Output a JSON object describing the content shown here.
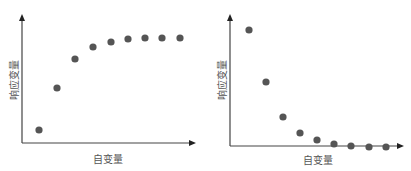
{
  "chart_data": [
    {
      "type": "scatter",
      "title": "",
      "xlabel": "自变量",
      "ylabel": "响应变量",
      "grid": false,
      "legend": null,
      "trend": "increasing, saturating (concave)",
      "x": [
        1,
        2,
        3,
        4,
        5,
        6,
        7,
        8,
        9
      ],
      "y": [
        0.12,
        0.53,
        0.8,
        0.91,
        0.96,
        0.99,
        1.0,
        1.0,
        1.0
      ],
      "point_color": "#555555",
      "axis_color": "#444444",
      "pixel_points": [
        [
          39,
          130
        ],
        [
          57,
          88
        ],
        [
          75,
          59
        ],
        [
          93,
          47
        ],
        [
          111,
          42
        ],
        [
          128,
          39
        ],
        [
          145,
          38
        ],
        [
          162,
          38
        ],
        [
          180,
          38
        ]
      ],
      "axes": {
        "origin": [
          22,
          143
        ],
        "x_end": 196,
        "y_top": 14
      }
    },
    {
      "type": "scatter",
      "title": "",
      "xlabel": "自变量",
      "ylabel": "响应变量",
      "grid": false,
      "legend": null,
      "trend": "decreasing, decaying (convex)",
      "x": [
        1,
        2,
        3,
        4,
        5,
        6,
        7,
        8,
        9
      ],
      "y": [
        1.0,
        0.55,
        0.24,
        0.11,
        0.05,
        0.02,
        0.01,
        0.0,
        0.0
      ],
      "point_color": "#555555",
      "axis_color": "#444444",
      "pixel_points": [
        [
          249,
          30
        ],
        [
          266,
          82
        ],
        [
          283,
          117
        ],
        [
          300,
          133
        ],
        [
          317,
          140
        ],
        [
          334,
          144
        ],
        [
          351,
          146
        ],
        [
          369,
          147
        ],
        [
          386,
          147
        ]
      ],
      "axes": {
        "origin": [
          230,
          146
        ],
        "x_end": 404,
        "y_top": 14
      }
    }
  ],
  "charts": [
    {
      "xlabel": "自变量",
      "ylabel": "响应变量"
    },
    {
      "xlabel": "自变量",
      "ylabel": "响应变量"
    }
  ]
}
